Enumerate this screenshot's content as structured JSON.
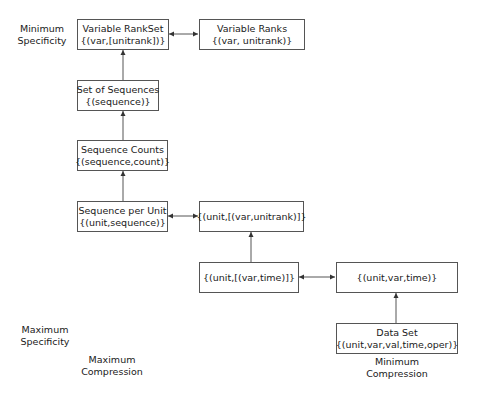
{
  "nodes": {
    "variable_rankset": {
      "title": "Variable RankSet",
      "schema": "{(var,[unitrank])}"
    },
    "variable_ranks": {
      "title": "Variable Ranks",
      "schema": "{(var, unitrank)}"
    },
    "set_of_sequences": {
      "title": "Set of Sequences",
      "schema": "{(sequence)}"
    },
    "sequence_counts": {
      "title": "Sequence Counts",
      "schema": "{(sequence,count)}"
    },
    "sequence_per_unit": {
      "title": "Sequence per Unit",
      "schema": "{(unit,sequence)}"
    },
    "unit_var_unitrank": {
      "title": "",
      "schema": "{(unit,[(var,unitrank)]}"
    },
    "unit_var_time_list": {
      "title": "",
      "schema": "{(unit,[(var,time)]}"
    },
    "unit_var_time": {
      "title": "",
      "schema": "{(unit,var,time)}"
    },
    "data_set": {
      "title": "Data Set",
      "schema": "{(unit,var,val,time,oper)}"
    }
  },
  "labels": {
    "min_specificity": {
      "line1": "Minimum",
      "line2": "Specificity"
    },
    "max_specificity": {
      "line1": "Maximum",
      "line2": "Specificity"
    },
    "max_compression": {
      "line1": "Maximum",
      "line2": "Compression"
    },
    "min_compression": {
      "line1": "Minimum",
      "line2": "Compression"
    }
  },
  "edges": [
    {
      "from": "data_set",
      "to": "unit_var_time",
      "type": "directed"
    },
    {
      "from": "unit_var_time",
      "to": "unit_var_time_list",
      "type": "bidirectional"
    },
    {
      "from": "unit_var_time_list",
      "to": "unit_var_unitrank",
      "type": "directed"
    },
    {
      "from": "unit_var_unitrank",
      "to": "sequence_per_unit",
      "type": "bidirectional"
    },
    {
      "from": "sequence_per_unit",
      "to": "sequence_counts",
      "type": "directed"
    },
    {
      "from": "sequence_counts",
      "to": "set_of_sequences",
      "type": "directed"
    },
    {
      "from": "set_of_sequences",
      "to": "variable_rankset",
      "type": "directed"
    },
    {
      "from": "variable_rankset",
      "to": "variable_ranks",
      "type": "bidirectional"
    }
  ],
  "colors": {
    "stroke": "#555555",
    "text": "#1a1a1a",
    "background": "#ffffff"
  }
}
